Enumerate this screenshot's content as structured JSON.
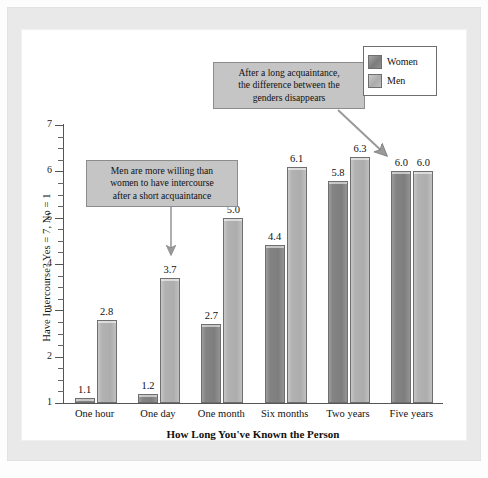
{
  "chart_data": {
    "type": "bar",
    "title": "",
    "xlabel": "How Long You've Known the Person",
    "ylabel": "Have Intercourse? Yes = 7, No = 1",
    "categories": [
      "One hour",
      "One day",
      "One month",
      "Six months",
      "Two years",
      "Five years"
    ],
    "series": [
      {
        "name": "Women",
        "color": "#878787",
        "values": [
          1.1,
          1.2,
          2.7,
          4.4,
          5.8,
          6.0
        ]
      },
      {
        "name": "Men",
        "color": "#b4b4b4",
        "values": [
          2.8,
          3.7,
          5.0,
          6.1,
          6.3,
          6.0
        ]
      }
    ],
    "ylim": [
      1,
      7
    ],
    "ytick_labels": [
      "1",
      "2",
      "3",
      "4",
      "5",
      "6",
      "7"
    ],
    "minor_ticks": true,
    "grid": false,
    "legend_position": "top-right",
    "annotations": [
      {
        "id": "short-acquaintance",
        "text": "Men are more willing than women to have intercourse after a short acquaintance",
        "lines": [
          "Men are more willing than",
          "women to have intercourse",
          "after a short acquaintance"
        ],
        "points_to": "One day / Men (3.7)",
        "arrow": "down"
      },
      {
        "id": "long-acquaintance",
        "text": "After a long acquaintance, the difference between the genders disappears",
        "lines": [
          "After a long acquaintance,",
          "the difference between the",
          "genders disappears"
        ],
        "points_to": "Five years (6.0 / 6.0)",
        "arrow": "diagonal-down-right"
      }
    ]
  },
  "legend": {
    "items": [
      {
        "label": "Women"
      },
      {
        "label": "Men"
      }
    ]
  },
  "colors": {
    "women_bar": "#878787",
    "men_bar": "#b4b4b4",
    "callout_bg": "#c5c5c5",
    "frame": "#e9e9e9",
    "axis": "#555555"
  }
}
